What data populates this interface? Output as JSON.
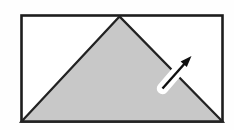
{
  "figure": {
    "canvas": {
      "width": 234,
      "height": 130,
      "background": "#fefefe"
    },
    "colors": {
      "paper": "#ffffff",
      "outline": "#1d1d1d",
      "triangle_fill": "#c8c8c8",
      "triangle_edge": "#222222",
      "halo": "#ffffff",
      "arrow": "#101010"
    },
    "rectangle": {
      "x": 21.5,
      "y": 15.5,
      "width": 201,
      "height": 106,
      "stroke_width": 2.6
    },
    "triangle": {
      "points": "119.5,16.5 21.5,121.5 222.5,121.5",
      "stroke_width": 2.3
    },
    "arrow": {
      "halo_path": "M162.5,88.5 L181,67",
      "halo_width": 11.5,
      "shaft_path": "M162.5,88.5 L184.5,63.8",
      "shaft_width": 2.4,
      "head_points": "191.5,56 186.8,67 180.6,61.6"
    }
  }
}
